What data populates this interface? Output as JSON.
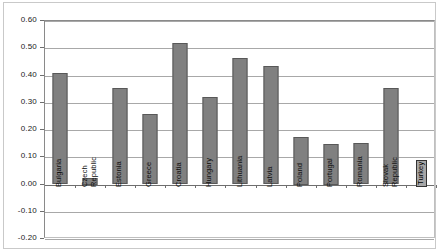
{
  "chart_data": {
    "type": "bar",
    "title": "",
    "subtitle": "",
    "xlabel": "",
    "ylabel": "",
    "ylim": [
      -0.2,
      0.6
    ],
    "ytick_values": [
      0.6,
      0.5,
      0.4,
      0.3,
      0.2,
      0.1,
      0.0,
      -0.1,
      -0.2
    ],
    "ytick_labels": [
      "0.60",
      "0.50",
      "0.40",
      "0.30",
      "0.20",
      "0.10",
      "0.00",
      "-0.10",
      "-0.20"
    ],
    "grid": true,
    "legend": null,
    "legend_position": "none",
    "bar_color": "#808080",
    "bar_border_color": "#585858",
    "highlight_color": "#a6a6a6",
    "categories": [
      "Bulgaria",
      "Czech\nRepublic",
      "Estonia",
      "Greece",
      "Croatia",
      "Hungary",
      "Lithuania",
      "Latvia",
      "Poland",
      "Portugal",
      "Romania",
      "Slovak\nRepublic",
      "Turkey"
    ],
    "values": [
      0.41,
      0.025,
      0.355,
      0.257,
      0.52,
      0.32,
      0.465,
      0.435,
      0.175,
      0.15,
      0.152,
      0.355,
      0.0
    ],
    "highlighted_categories": [
      "Turkey"
    ]
  }
}
